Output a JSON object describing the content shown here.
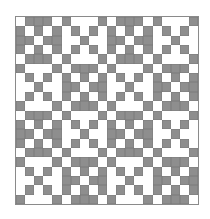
{
  "pattern": {
    "blocks_per_side": 4,
    "cells_per_block": 5,
    "base_block": [
      [
        0,
        1,
        1,
        1,
        0
      ],
      [
        1,
        0,
        1,
        0,
        1
      ],
      [
        1,
        1,
        0,
        1,
        1
      ],
      [
        1,
        0,
        1,
        0,
        1
      ],
      [
        0,
        1,
        1,
        1,
        0
      ]
    ],
    "arrangement": "checkerboard of base block and its inverse",
    "colors": {
      "filled": "#8e8e8e",
      "empty": "#ffffff",
      "outline": "#7a7a7a"
    }
  }
}
